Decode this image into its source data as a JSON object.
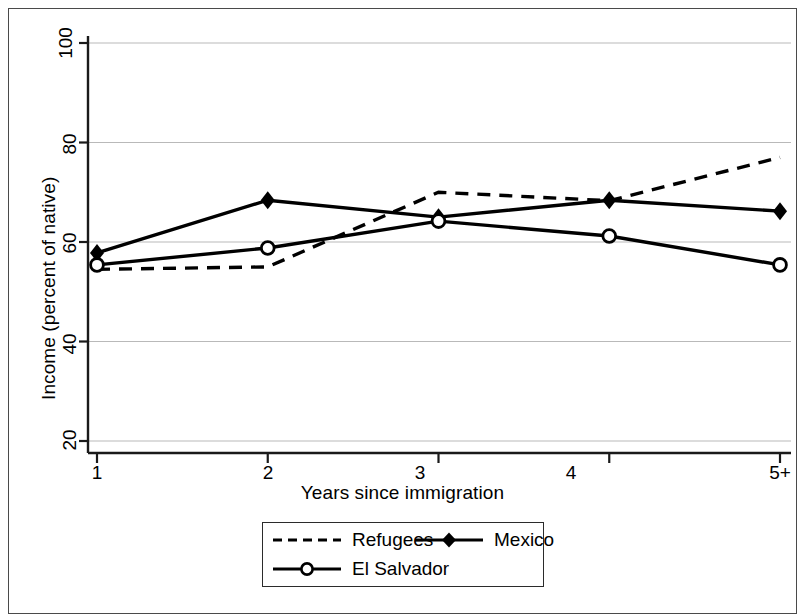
{
  "chart_data": {
    "type": "line",
    "title": "",
    "subtitle": "",
    "xlabel": "Years since immigration",
    "ylabel": "Income (percent of native)",
    "categories": [
      "1",
      "2",
      "3",
      "4",
      "5+"
    ],
    "x": [
      1,
      2,
      3,
      4,
      5
    ],
    "xlim": [
      1,
      5
    ],
    "ylim": [
      20,
      100
    ],
    "yticks": [
      20,
      40,
      60,
      80,
      100
    ],
    "ytick_labels": [
      "20",
      "40",
      "60",
      "80",
      "100"
    ],
    "xtick_labels": [
      "1",
      "2",
      "3",
      "4",
      "5+"
    ],
    "grid": "horizontal",
    "grid_color": "#b9b9b9",
    "legend_position": "below-center",
    "series": [
      {
        "name": "Refugees",
        "values": [
          54.5,
          55.0,
          70.0,
          68.3,
          77.0
        ],
        "style": "dashed",
        "marker": "none",
        "color": "#000000"
      },
      {
        "name": "Mexico",
        "values": [
          57.8,
          68.4,
          65.0,
          68.4,
          66.2
        ],
        "style": "solid",
        "marker": "filled-diamond",
        "color": "#000000"
      },
      {
        "name": "El Salvador",
        "values": [
          55.4,
          58.8,
          64.2,
          61.2,
          55.4
        ],
        "style": "solid",
        "marker": "open-circle",
        "color": "#000000"
      }
    ]
  },
  "legend": {
    "items": [
      {
        "label": "Refugees",
        "swatch": "dashed-line-swatch"
      },
      {
        "label": "Mexico",
        "swatch": "solid-line-diamond-swatch"
      },
      {
        "label": "El Salvador",
        "swatch": "solid-line-circle-swatch"
      }
    ]
  },
  "axes": {
    "y_title": "Income (percent of native)",
    "x_title": "Years since immigration",
    "y_ticks": [
      "20",
      "40",
      "60",
      "80",
      "100"
    ],
    "x_ticks": [
      "1",
      "2",
      "3",
      "4",
      "5+"
    ]
  }
}
